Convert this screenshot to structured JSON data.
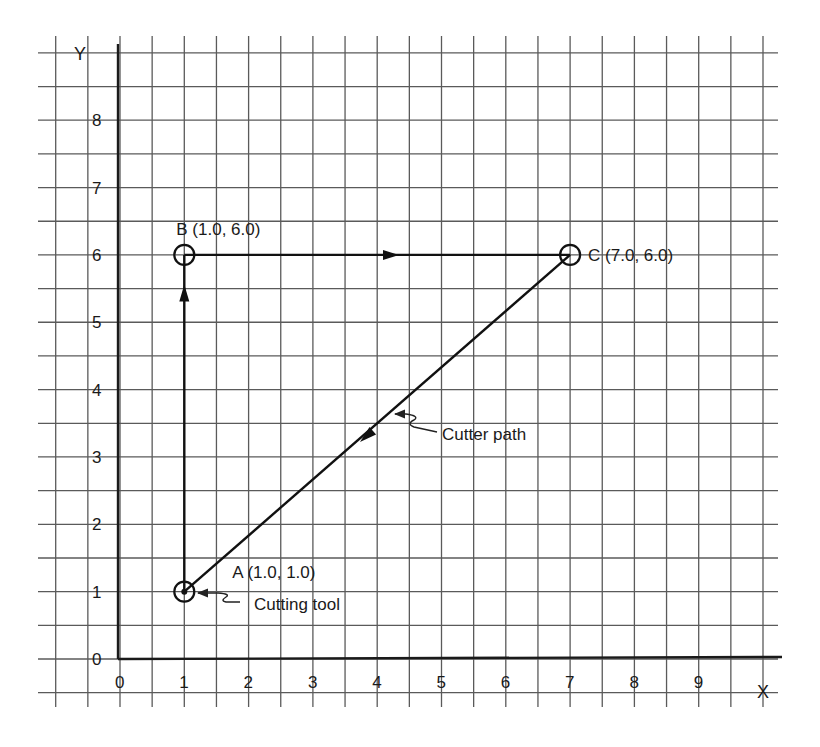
{
  "diagram": {
    "axes": {
      "x_name": "X",
      "y_name": "Y",
      "x_ticks": [
        "0",
        "1",
        "2",
        "3",
        "4",
        "5",
        "6",
        "7",
        "8",
        "9"
      ],
      "y_ticks": [
        "0",
        "1",
        "2",
        "3",
        "4",
        "5",
        "6",
        "7",
        "8"
      ]
    },
    "points": [
      {
        "id": "A",
        "x": 1.0,
        "y": 1.0,
        "label": "A (1.0, 1.0)"
      },
      {
        "id": "B",
        "x": 1.0,
        "y": 6.0,
        "label": "B (1.0, 6.0)"
      },
      {
        "id": "C",
        "x": 7.0,
        "y": 6.0,
        "label": "C (7.0, 6.0)"
      }
    ],
    "path": [
      {
        "from": "A",
        "to": "B",
        "direction": "up"
      },
      {
        "from": "B",
        "to": "C",
        "direction": "right"
      },
      {
        "from": "C",
        "to": "A",
        "direction": "down-left"
      }
    ],
    "annotations": [
      {
        "id": "cutting-tool",
        "text": "Cutting tool",
        "points_to": "A"
      },
      {
        "id": "cutter-path",
        "text": "Cutter path",
        "points_to": "C-A segment"
      }
    ],
    "colors": {
      "line": "#111111",
      "grid": "#5a5a5a",
      "background": "#ffffff"
    }
  }
}
